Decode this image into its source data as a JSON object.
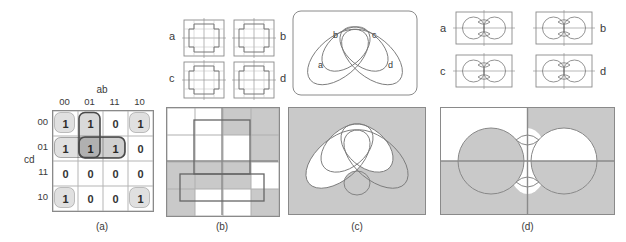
{
  "colors": {
    "gray_fill": "#c9c9c9",
    "outline": "#888888",
    "bold_outline": "#555555",
    "cell_white": "#ffffff"
  },
  "panel_a": {
    "caption": "(a)",
    "top_label": "ab",
    "side_label": "cd",
    "col_headers": [
      "00",
      "01",
      "11",
      "10"
    ],
    "row_headers": [
      "00",
      "01",
      "11",
      "10"
    ],
    "rows": [
      [
        "1",
        "1",
        "0",
        "1"
      ],
      [
        "1",
        "1",
        "1",
        "0"
      ],
      [
        "0",
        "0",
        "0",
        "0"
      ],
      [
        "1",
        "0",
        "0",
        "1"
      ]
    ]
  },
  "panel_b": {
    "caption": "(b)",
    "region_labels": [
      "a",
      "b",
      "c",
      "d"
    ],
    "grid": [
      [
        "W",
        "W",
        "G",
        "G"
      ],
      [
        "W",
        "W",
        "W",
        "G"
      ],
      [
        "G",
        "G",
        "G",
        "W"
      ],
      [
        "G",
        "W",
        "W",
        "G"
      ]
    ]
  },
  "panel_c": {
    "caption": "(c)",
    "set_labels": [
      "a",
      "b",
      "c",
      "d"
    ]
  },
  "panel_d": {
    "caption": "(d)",
    "region_labels": [
      "a",
      "b",
      "c",
      "d"
    ]
  }
}
